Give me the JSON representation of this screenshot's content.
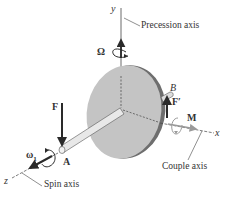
{
  "diagram": {
    "labels": {
      "y_axis": "y",
      "x_axis": "x",
      "z_axis": "z",
      "precession_axis": "Precession axis",
      "spin_axis": "Spin axis",
      "couple_axis": "Couple axis",
      "omega_precession": "Ω",
      "omega_spin": "ω",
      "omega_spin_sub": "1",
      "force": "F",
      "force_prime": "F′",
      "moment": "M",
      "point_a": "A",
      "point_b": "B"
    },
    "colors": {
      "disk_face": "#c4c4c4",
      "disk_rim": "#6e6e6e",
      "arrow": "#2a2a2a",
      "axis_line": "#444444",
      "moment_arrow": "#9a9a9a"
    }
  }
}
